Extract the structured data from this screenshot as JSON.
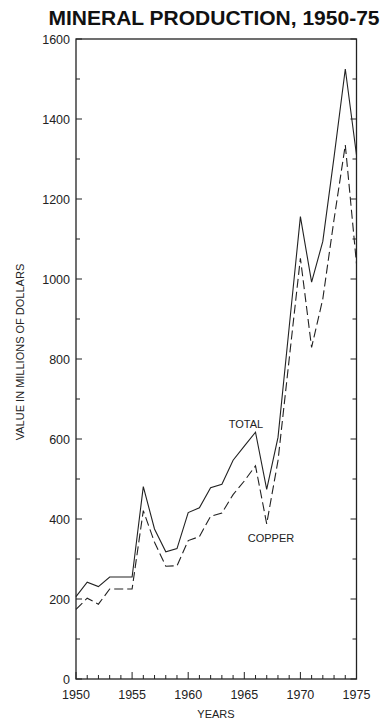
{
  "chart_data": {
    "type": "line",
    "title": "MINERAL PRODUCTION, 1950-75",
    "xlabel": "YEARS",
    "ylabel": "VALUE IN MILLIONS OF DOLLARS",
    "xlim": [
      1950,
      1975
    ],
    "ylim": [
      0,
      1600
    ],
    "x_ticks_major": [
      1950,
      1955,
      1960,
      1965,
      1970,
      1975
    ],
    "x_ticks_minor_step": 1,
    "y_ticks_major": [
      0,
      200,
      400,
      600,
      800,
      1000,
      1200,
      1400,
      1600
    ],
    "y_ticks_minor_step": 100,
    "grid": false,
    "legend": "inline labels",
    "x": [
      1950,
      1951,
      1952,
      1953,
      1954,
      1955,
      1956,
      1957,
      1958,
      1959,
      1960,
      1961,
      1962,
      1963,
      1964,
      1965,
      1966,
      1967,
      1968,
      1969,
      1970,
      1971,
      1972,
      1973,
      1974,
      1975
    ],
    "series": [
      {
        "name": "TOTAL",
        "style": "solid",
        "label_pos": {
          "x": 246,
          "y": 428
        },
        "values": [
          206,
          242,
          231,
          255,
          255,
          255,
          481,
          375,
          318,
          326,
          416,
          428,
          478,
          487,
          547,
          582,
          617,
          474,
          604,
          880,
          1156,
          992,
          1094,
          1306,
          1525,
          1310
        ]
      },
      {
        "name": "COPPER",
        "style": "dashed",
        "label_pos": {
          "x": 271,
          "y": 542
        },
        "values": [
          174,
          202,
          187,
          225,
          225,
          225,
          421,
          342,
          282,
          283,
          346,
          356,
          407,
          415,
          461,
          495,
          533,
          388,
          546,
          800,
          1052,
          829,
          950,
          1150,
          1335,
          1038
        ]
      }
    ]
  }
}
